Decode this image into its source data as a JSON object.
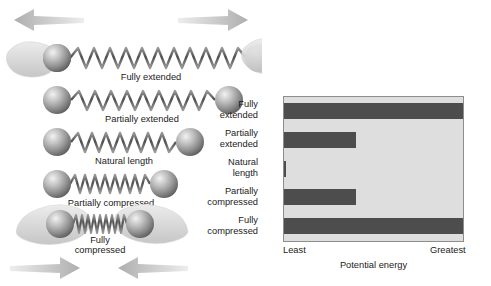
{
  "diagram": {
    "top_arrows": {
      "left": "arrow-left",
      "right": "arrow-right"
    },
    "bottom_arrows": {
      "left": "arrow-right",
      "right": "arrow-left"
    },
    "rows": [
      {
        "label": "Fully extended",
        "state": "fully-extended",
        "hands": true,
        "coils": 11,
        "span": 236,
        "ball": "sphere"
      },
      {
        "label": "Partially extended",
        "state": "partially-extended",
        "hands": false,
        "coils": 11,
        "span": 174,
        "ball": "sphere"
      },
      {
        "label": "Natural length",
        "state": "natural-length",
        "hands": false,
        "coils": 11,
        "span": 134,
        "ball": "sphere"
      },
      {
        "label": "Partially compressed",
        "state": "partially-compressed",
        "hands": false,
        "coils": 11,
        "span": 104,
        "ball": "sphere"
      },
      {
        "label": "Fully compressed",
        "state": "fully-compressed",
        "hands": true,
        "coils": 16,
        "span": 78,
        "ball": "sphere"
      }
    ]
  },
  "chart_data": {
    "type": "bar",
    "orientation": "horizontal",
    "title": "",
    "xlabel": "Potential energy",
    "ylabel": "",
    "categories": [
      "Fully\nextended",
      "Partially\nextended",
      "Natural\nlength",
      "Partially\ncompressed",
      "Fully\ncompressed"
    ],
    "values": [
      100,
      40,
      1,
      40,
      100
    ],
    "xlim": [
      0,
      100
    ],
    "xtick_labels": [
      "Least",
      "Greatest"
    ],
    "grid": false,
    "legend": "none",
    "bar_color": "#4d4d4d",
    "plot_background": "#dedede",
    "plot_border": "#8d8d8d"
  },
  "colors": {
    "bar": "#4d4d4d",
    "plot_bg": "#dedede",
    "page_bg": "#ffffff",
    "text": "#1b1b1b",
    "arrow": "#c9c9c9",
    "hand": "#dcdcdc"
  }
}
